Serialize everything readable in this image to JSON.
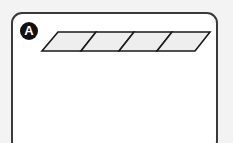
{
  "figure": {
    "label": "A",
    "cells": 4,
    "cell_fill": "#eeeeee",
    "stroke": "#1a1a1a"
  }
}
